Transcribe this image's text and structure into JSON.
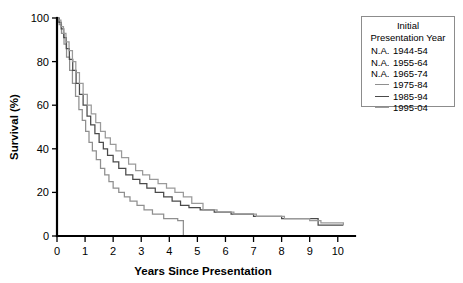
{
  "chart_data": {
    "type": "line",
    "title": "",
    "xlabel": "Years Since Presentation",
    "ylabel": "Survival (%)",
    "xlim": [
      0,
      10.4
    ],
    "ylim": [
      0,
      100
    ],
    "xticks": [
      "0",
      "1",
      "2",
      "3",
      "4",
      "5",
      "6",
      "7",
      "8",
      "9",
      "10"
    ],
    "yticks": [
      "0",
      "20",
      "40",
      "60",
      "80",
      "100"
    ],
    "grid": false,
    "legend_position": "outside-right-top",
    "legend_title": [
      "Initial",
      "Presentation Year"
    ],
    "series": [
      {
        "name": "1944-54",
        "key_text": "N.A.",
        "available": false,
        "color": "#000000",
        "points": []
      },
      {
        "name": "1955-64",
        "key_text": "N.A.",
        "available": false,
        "color": "#000000",
        "points": []
      },
      {
        "name": "1965-74",
        "key_text": "N.A.",
        "available": false,
        "color": "#000000",
        "points": []
      },
      {
        "name": "1975-84",
        "key_text": "line",
        "available": true,
        "color": "#8f8f8f",
        "points": [
          [
            0,
            100
          ],
          [
            0.08,
            97
          ],
          [
            0.16,
            93
          ],
          [
            0.25,
            88
          ],
          [
            0.34,
            82
          ],
          [
            0.45,
            76
          ],
          [
            0.55,
            70
          ],
          [
            0.66,
            64
          ],
          [
            0.78,
            58
          ],
          [
            0.9,
            53
          ],
          [
            1.02,
            48
          ],
          [
            1.14,
            43
          ],
          [
            1.26,
            39
          ],
          [
            1.4,
            35
          ],
          [
            1.55,
            31
          ],
          [
            1.7,
            28
          ],
          [
            1.85,
            25
          ],
          [
            2.0,
            22
          ],
          [
            2.2,
            20
          ],
          [
            2.4,
            18
          ],
          [
            2.6,
            16
          ],
          [
            2.85,
            14
          ],
          [
            3.1,
            12
          ],
          [
            3.4,
            10
          ],
          [
            3.8,
            8
          ],
          [
            4.3,
            7
          ],
          [
            4.5,
            0
          ]
        ]
      },
      {
        "name": "1985-94",
        "key_text": "line",
        "available": true,
        "color": "#4a4a4a",
        "points": [
          [
            0,
            100
          ],
          [
            0.07,
            98
          ],
          [
            0.15,
            95
          ],
          [
            0.24,
            91
          ],
          [
            0.33,
            86
          ],
          [
            0.44,
            81
          ],
          [
            0.56,
            76
          ],
          [
            0.68,
            70
          ],
          [
            0.8,
            65
          ],
          [
            0.93,
            60
          ],
          [
            1.07,
            55
          ],
          [
            1.2,
            51
          ],
          [
            1.35,
            47
          ],
          [
            1.5,
            43
          ],
          [
            1.65,
            40
          ],
          [
            1.8,
            37
          ],
          [
            2.0,
            34
          ],
          [
            2.2,
            31
          ],
          [
            2.45,
            28
          ],
          [
            2.7,
            26
          ],
          [
            2.95,
            24
          ],
          [
            3.2,
            22
          ],
          [
            3.5,
            20
          ],
          [
            3.8,
            18
          ],
          [
            4.1,
            16
          ],
          [
            4.4,
            14
          ],
          [
            4.7,
            13
          ],
          [
            5.1,
            12
          ],
          [
            5.6,
            11
          ],
          [
            6.2,
            10
          ],
          [
            7.0,
            9
          ],
          [
            8.0,
            8
          ],
          [
            9.3,
            5
          ],
          [
            10.2,
            5
          ]
        ]
      },
      {
        "name": "1995-04",
        "key_text": "line",
        "available": true,
        "color": "#9a9a9a",
        "points": [
          [
            0,
            100
          ],
          [
            0.06,
            99
          ],
          [
            0.14,
            96
          ],
          [
            0.23,
            93
          ],
          [
            0.32,
            89
          ],
          [
            0.43,
            85
          ],
          [
            0.55,
            80
          ],
          [
            0.67,
            75
          ],
          [
            0.8,
            70
          ],
          [
            0.93,
            65
          ],
          [
            1.08,
            60
          ],
          [
            1.22,
            56
          ],
          [
            1.38,
            52
          ],
          [
            1.55,
            48
          ],
          [
            1.72,
            45
          ],
          [
            1.9,
            42
          ],
          [
            2.1,
            39
          ],
          [
            2.3,
            36
          ],
          [
            2.55,
            33
          ],
          [
            2.8,
            30
          ],
          [
            3.05,
            28
          ],
          [
            3.3,
            26
          ],
          [
            3.6,
            24
          ],
          [
            3.9,
            22
          ],
          [
            4.2,
            20
          ],
          [
            4.5,
            18
          ],
          [
            4.8,
            15
          ],
          [
            5.2,
            12
          ],
          [
            5.7,
            11
          ],
          [
            6.3,
            10
          ],
          [
            7.1,
            9
          ],
          [
            8.1,
            8
          ],
          [
            9.0,
            7
          ],
          [
            9.4,
            6
          ],
          [
            10.2,
            5
          ]
        ]
      }
    ]
  }
}
